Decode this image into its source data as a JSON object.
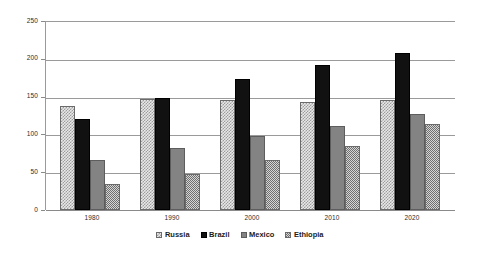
{
  "chart_data": {
    "type": "bar",
    "title": "",
    "subtitle": "",
    "xlabel": "",
    "ylabel": "",
    "categories": [
      "1980",
      "1990",
      "2000",
      "2010",
      "2020"
    ],
    "series": [
      {
        "name": "Russia",
        "values": [
          139,
          148,
          147,
          144,
          147
        ],
        "color": "#e8e8e8",
        "pattern": "checker-light"
      },
      {
        "name": "Brazil",
        "values": [
          121,
          149,
          174,
          193,
          209
        ],
        "color": "#111111",
        "pattern": "solid"
      },
      {
        "name": "Mexico",
        "values": [
          67,
          82,
          98,
          112,
          128
        ],
        "color": "#838383",
        "pattern": "solid"
      },
      {
        "name": "Ethiopia",
        "values": [
          35,
          48,
          66,
          85,
          114
        ],
        "color": "#d6d6d6",
        "pattern": "checker-fine"
      }
    ],
    "ylim": [
      0,
      250
    ],
    "yticks": [
      0,
      50,
      100,
      150,
      200,
      250
    ],
    "ytick_labels": [
      "0",
      "50",
      "100",
      "150",
      "200",
      "250"
    ],
    "grid": true,
    "grid_axis": "y",
    "legend_position": "bottom",
    "legend_entries": [
      "Russia",
      "Brazil",
      "Mexico",
      "Ethiopia"
    ],
    "annotations": []
  },
  "axes": {
    "y_tick_labels": [
      "250",
      "200",
      "150",
      "100",
      "50",
      "0"
    ],
    "x_tick_labels": [
      "1980",
      "1990",
      "2000",
      "2010",
      "2020"
    ]
  },
  "legend": {
    "items": [
      {
        "label": "Russia"
      },
      {
        "label": "Brazil"
      },
      {
        "label": "Mexico"
      },
      {
        "label": "Ethiopia"
      }
    ]
  }
}
